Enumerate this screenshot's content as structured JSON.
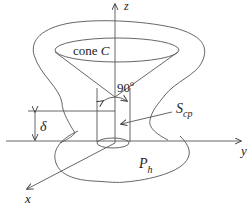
{
  "diagram": {
    "axes": {
      "z_label": "z",
      "y_label": "y",
      "x_label": "x"
    },
    "labels": {
      "cone_prefix": "cone ",
      "cone_name": "C",
      "angle": "90",
      "angle_unit": "o",
      "delta": "δ",
      "surface_main": "S",
      "surface_sub": "cp",
      "pressure_main": "P",
      "pressure_sub": "h"
    },
    "colors": {
      "line": "#555555",
      "text": "#222222",
      "background": "#ffffff"
    }
  }
}
